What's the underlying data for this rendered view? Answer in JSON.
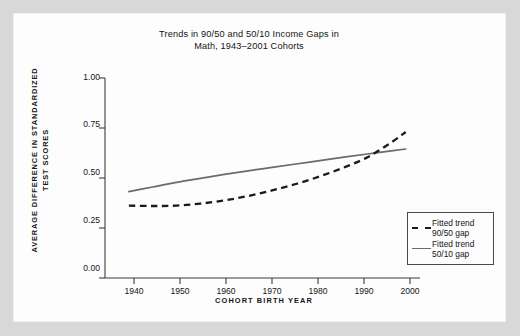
{
  "figure": {
    "title_line1": "Trends in 90/50 and 50/10 Income Gaps in",
    "title_line2": "Math, 1943–2001 Cohorts"
  },
  "axes": {
    "ylabel_line1": "AVERAGE DIFFERENCE IN STANDARDIZED",
    "ylabel_line2": "TEST SCORES",
    "xlabel": "COHORT BIRTH YEAR",
    "yticks": [
      "1.00",
      "0.75",
      "0.50",
      "0.25",
      "0.00"
    ],
    "xticks": [
      "1940",
      "1950",
      "1960",
      "1970",
      "1980",
      "1990",
      "2000"
    ]
  },
  "legend": {
    "items": [
      {
        "line1": "Fitted trend",
        "line2": "90/50 gap",
        "style": "dashed",
        "color": "#1a1a1a"
      },
      {
        "line1": "Fitted trend",
        "line2": "50/10 gap",
        "style": "solid",
        "color": "#6b6b6b"
      }
    ]
  },
  "chart_data": {
    "type": "line",
    "title": "Trends in 90/50 and 50/10 Income Gaps in Math, 1943–2001 Cohorts",
    "xlabel": "COHORT BIRTH YEAR",
    "ylabel": "AVERAGE DIFFERENCE IN STANDARDIZED TEST SCORES",
    "xlim": [
      1938,
      2004
    ],
    "ylim": [
      0.0,
      1.0
    ],
    "xticks": [
      1940,
      1950,
      1960,
      1970,
      1980,
      1990,
      2000
    ],
    "yticks": [
      0.0,
      0.25,
      0.5,
      0.75,
      1.0
    ],
    "grid": false,
    "legend_position": "lower-right-outside",
    "x": [
      1943,
      1948,
      1953,
      1958,
      1963,
      1968,
      1973,
      1978,
      1983,
      1988,
      1993,
      1998,
      2001
    ],
    "series": [
      {
        "name": "Fitted trend 90/50 gap",
        "style": "dashed",
        "color": "#1a1a1a",
        "values": [
          0.362,
          0.36,
          0.362,
          0.372,
          0.388,
          0.41,
          0.438,
          0.47,
          0.508,
          0.552,
          0.604,
          0.678,
          0.73
        ]
      },
      {
        "name": "Fitted trend 50/10 gap",
        "style": "solid",
        "color": "#6b6b6b",
        "values": [
          0.432,
          0.455,
          0.478,
          0.498,
          0.518,
          0.536,
          0.553,
          0.57,
          0.587,
          0.604,
          0.62,
          0.636,
          0.645
        ]
      }
    ]
  }
}
